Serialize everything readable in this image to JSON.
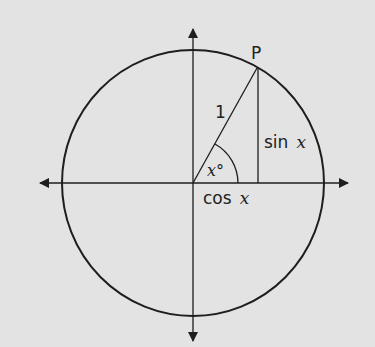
{
  "diagram": {
    "type": "unit-circle",
    "background": "#e3e3e3",
    "stroke_color": "#1e1e1e",
    "labels": {
      "point": "P",
      "radius": "1",
      "sin_word": "sin",
      "cos_word": "cos",
      "variable": "x",
      "angle": "x°"
    },
    "geometry": {
      "center": [
        193,
        183
      ],
      "circle_radius_x": 131,
      "circle_radius_y": 133,
      "point_P": [
        257,
        68
      ],
      "angle_arc_radius": 45
    }
  }
}
